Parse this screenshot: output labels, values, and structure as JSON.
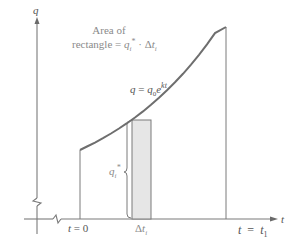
{
  "diagram": {
    "type": "exponential-growth-area-diagram",
    "axes": {
      "y_label": "q",
      "x_label": "t"
    },
    "annotation": {
      "line1": "Area of",
      "line2_prefix": "rectangle = ",
      "line2_q": "q",
      "line2_q_sub": "i",
      "line2_q_sup": "*",
      "line2_dot": " · Δ",
      "line2_t": "t",
      "line2_t_sub": "i"
    },
    "curve_label": {
      "lhs": "q",
      "eq": " = ",
      "q": "q",
      "q_sub": "0",
      "e": "e",
      "exp": "kt"
    },
    "brace_label": {
      "q": "q",
      "sub": "i",
      "sup": "*"
    },
    "x_ticks": {
      "start": "t = 0",
      "start_t": "t",
      "start_rest": " = 0",
      "delta": "Δ",
      "delta_t": "t",
      "delta_sub": "i",
      "end_t": "t",
      "end_eq": "  =  ",
      "end_t1": "t",
      "end_sub": "1"
    },
    "colors": {
      "axis": "#7a7a7a",
      "curve": "#6e6e6e",
      "rectangle_fill": "#e6e6e6",
      "text_light": "#8a8a8a",
      "text_dark": "#555555"
    }
  }
}
